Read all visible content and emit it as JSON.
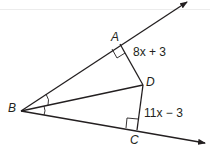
{
  "diagram": {
    "points": {
      "A": {
        "label": "A",
        "x": 120,
        "y": 44
      },
      "B": {
        "label": "B",
        "x": 21,
        "y": 111
      },
      "C": {
        "label": "C",
        "x": 137,
        "y": 130
      },
      "D": {
        "label": "D",
        "x": 143,
        "y": 85
      }
    },
    "segment_labels": {
      "AD": "8x + 3",
      "DC": "11x − 3"
    },
    "marks": {
      "right_angles": [
        "A",
        "C"
      ],
      "congruent_angles": [
        "ABD",
        "DBC"
      ]
    },
    "rays": [
      "BA",
      "BC"
    ],
    "colors": {
      "stroke": "#231f20",
      "background": "#ffffff"
    }
  }
}
